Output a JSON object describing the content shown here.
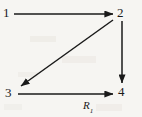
{
  "diagram": {
    "type": "directed-graph",
    "background_color": "#f6f5f2",
    "stroke_color": "#1a1a1a",
    "nodes": [
      {
        "id": "1",
        "label": "1",
        "x": 8,
        "y": 13
      },
      {
        "id": "2",
        "label": "2",
        "x": 121,
        "y": 13
      },
      {
        "id": "3",
        "label": "3",
        "x": 10,
        "y": 93
      },
      {
        "id": "4",
        "label": "4",
        "x": 122,
        "y": 92
      }
    ],
    "edges": [
      {
        "id": "edge-1-2",
        "from": "1",
        "to": "2",
        "direction": "right",
        "label": "",
        "x1": 14,
        "y1": 14,
        "x2": 113,
        "y2": 14
      },
      {
        "id": "edge-2-4",
        "from": "2",
        "to": "4",
        "direction": "down",
        "label": "",
        "x1": 122,
        "y1": 21,
        "x2": 122,
        "y2": 83
      },
      {
        "id": "edge-2-3",
        "from": "2",
        "to": "3",
        "direction": "down-left",
        "label": "",
        "x1": 113,
        "y1": 20,
        "x2": 21,
        "y2": 86
      },
      {
        "id": "edge-3-4",
        "from": "3",
        "to": "4",
        "direction": "right",
        "label": "R1",
        "x1": 18,
        "y1": 94,
        "x2": 113,
        "y2": 94
      }
    ],
    "edge_labels": {
      "r1_base": "R",
      "r1_subscript": "1"
    }
  }
}
